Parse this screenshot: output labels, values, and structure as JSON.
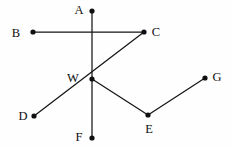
{
  "figure": {
    "type": "geometry-line-diagram",
    "canvas": {
      "width": 232,
      "height": 149
    },
    "background_color": "#fefefe",
    "line_color": "#151515",
    "label_color": "#101010",
    "dot_color": "#101010",
    "dot_radius": 2.6,
    "line_width": 1.25,
    "points": [
      {
        "id": "A",
        "label": "A",
        "x": 92,
        "y": 11,
        "label_x": 79,
        "label_y": 10,
        "has_dot": true
      },
      {
        "id": "B",
        "label": "B",
        "x": 33,
        "y": 32,
        "label_x": 16,
        "label_y": 33,
        "has_dot": true
      },
      {
        "id": "C",
        "label": "C",
        "x": 144,
        "y": 32,
        "label_x": 156,
        "label_y": 32,
        "has_dot": true
      },
      {
        "id": "W",
        "label": "W",
        "x": 92,
        "y": 79,
        "label_x": 73,
        "label_y": 78,
        "has_dot": true
      },
      {
        "id": "G",
        "label": "G",
        "x": 205,
        "y": 78,
        "label_x": 217,
        "label_y": 77,
        "has_dot": true
      },
      {
        "id": "D",
        "label": "D",
        "x": 34,
        "y": 116,
        "label_x": 23,
        "label_y": 116,
        "has_dot": true
      },
      {
        "id": "E",
        "label": "E",
        "x": 148,
        "y": 115,
        "label_x": 149,
        "label_y": 129,
        "has_dot": true
      },
      {
        "id": "F",
        "label": "F",
        "x": 92,
        "y": 138,
        "label_x": 79,
        "label_y": 137,
        "has_dot": true
      }
    ],
    "segments": [
      {
        "id": "A-F",
        "from": "A",
        "to": "F",
        "description": "vertical line through W from A down to F"
      },
      {
        "id": "B-C",
        "from": "B",
        "to": "C",
        "description": "line from B down-right through W up to C"
      },
      {
        "id": "D-C",
        "from": "D",
        "to": "C",
        "description": "line from D up-right through W to C"
      },
      {
        "id": "W-E",
        "from": "W",
        "to": "E",
        "description": "segment from W down-right to E"
      },
      {
        "id": "E-G",
        "from": "E",
        "to": "G",
        "description": "segment from E up-right to G"
      }
    ]
  }
}
